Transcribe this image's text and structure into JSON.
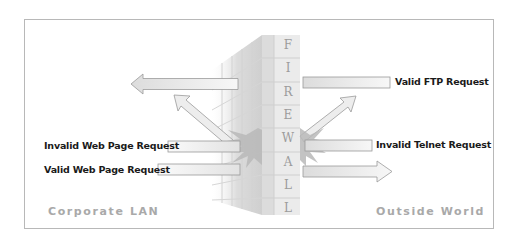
{
  "diagram": {
    "title_wall": "FIREWALL",
    "wall_letters": [
      "F",
      "I",
      "R",
      "E",
      "W",
      "A",
      "L",
      "L"
    ],
    "zones": {
      "left": "Corporate LAN",
      "right": "Outside World"
    },
    "left_requests": [
      {
        "label": "Invalid Web Page Request",
        "status": "blocked"
      },
      {
        "label": "Valid Web Page Request",
        "status": "allowed"
      }
    ],
    "right_requests": [
      {
        "label": "Valid FTP Request",
        "status": "allowed"
      },
      {
        "label": "Invalid Telnet Request",
        "status": "blocked"
      }
    ],
    "colors": {
      "wall_face": "#e6e6e6",
      "wall_grid": "#c8c8c8",
      "arrow_fill": "#f0f0f0",
      "arrow_stroke": "#9a9a9a",
      "burst": "#b5b5b5",
      "text": "#1a1a1a",
      "zone_text": "#a9a9a9",
      "frame": "#b8b8b8"
    }
  }
}
